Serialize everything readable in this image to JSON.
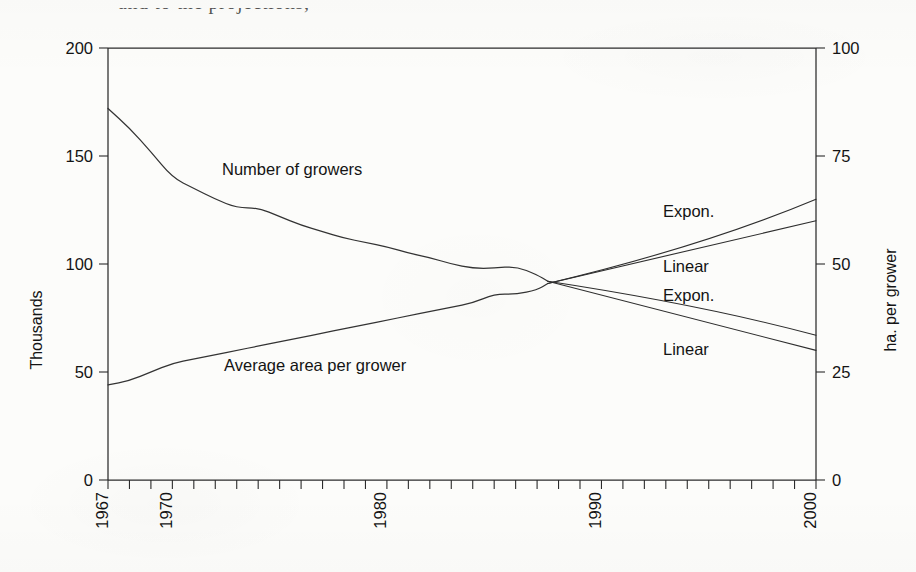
{
  "figure": {
    "cropped_caption_fragment": "and to the projections,",
    "background_color": "#fcfcfa",
    "line_color": "#333333"
  },
  "chart_data": {
    "type": "line",
    "title": "",
    "xlabel": "",
    "grid": false,
    "legend_position": "inline-annotations",
    "xlim": [
      1967,
      2000
    ],
    "x_tick_interval": 1,
    "x_tick_labels": [
      "1967",
      "1970",
      "1980",
      "1990",
      "2000"
    ],
    "x_tick_label_values": [
      1967,
      1970,
      1980,
      1990,
      2000
    ],
    "x_tick_label_rotation": -90,
    "left_axis": {
      "label": "Thousands",
      "ylim": [
        0,
        200
      ],
      "ticks": [
        0,
        50,
        100,
        150,
        200
      ],
      "tick_labels": [
        "0",
        "50",
        "100",
        "150",
        "200"
      ]
    },
    "right_axis": {
      "label": "ha. per grower",
      "ylim": [
        0,
        100
      ],
      "ticks": [
        0,
        25,
        50,
        75,
        100
      ],
      "tick_labels": [
        "0",
        "25",
        "50",
        "75",
        "100"
      ]
    },
    "series": [
      {
        "name": "Number of growers",
        "axis": "left",
        "units": "thousands",
        "label_text": "Number of growers",
        "x": [
          1967,
          1968,
          1969,
          1970,
          1971,
          1972,
          1973,
          1974,
          1975,
          1976,
          1977,
          1978,
          1979,
          1980,
          1981,
          1982,
          1983,
          1984,
          1985,
          1986,
          1987,
          1987.5
        ],
        "values": [
          172,
          163,
          152,
          140,
          135,
          130,
          126,
          126,
          122,
          118,
          115,
          112,
          110,
          108,
          105,
          103,
          100,
          98,
          98,
          99,
          95,
          92
        ]
      },
      {
        "name": "Average area per grower",
        "axis": "right",
        "units": "ha. per grower",
        "label_text": "Average area per grower",
        "x": [
          1967,
          1968,
          1969,
          1970,
          1971,
          1972,
          1973,
          1974,
          1975,
          1976,
          1977,
          1978,
          1979,
          1980,
          1981,
          1982,
          1983,
          1984,
          1985,
          1986,
          1987,
          1987.5
        ],
        "values": [
          22,
          23,
          25,
          27,
          28,
          29,
          30,
          31,
          32,
          33,
          34,
          35,
          36,
          37,
          38,
          39,
          40,
          41,
          43,
          43,
          44,
          45.5
        ]
      }
    ],
    "projections": [
      {
        "name": "Average area per grower - exponential projection",
        "label": "Expon.",
        "axis": "right",
        "direction": "up",
        "x": [
          1987.5,
          2000
        ],
        "values": [
          45.5,
          65
        ]
      },
      {
        "name": "Average area per grower - linear projection",
        "label": "Linear",
        "axis": "right",
        "direction": "up",
        "x": [
          1987.5,
          2000
        ],
        "values": [
          45.5,
          60
        ]
      },
      {
        "name": "Number of growers - exponential projection",
        "label": "Expon.",
        "axis": "left",
        "direction": "down",
        "x": [
          1987.5,
          2000
        ],
        "values": [
          92,
          67
        ]
      },
      {
        "name": "Number of growers - linear projection",
        "label": "Linear",
        "axis": "left",
        "direction": "down",
        "x": [
          1987.5,
          2000
        ],
        "values": [
          92,
          60
        ]
      }
    ],
    "annotations": [
      {
        "name": "growers-series-label",
        "text": "Number of growers"
      },
      {
        "name": "area-series-label",
        "text": "Average area per grower"
      },
      {
        "name": "projection-label-expon-upper",
        "text": "Expon."
      },
      {
        "name": "projection-label-linear-upper",
        "text": "Linear"
      },
      {
        "name": "projection-label-expon-lower",
        "text": "Expon."
      },
      {
        "name": "projection-label-linear-lower",
        "text": "Linear"
      }
    ]
  }
}
